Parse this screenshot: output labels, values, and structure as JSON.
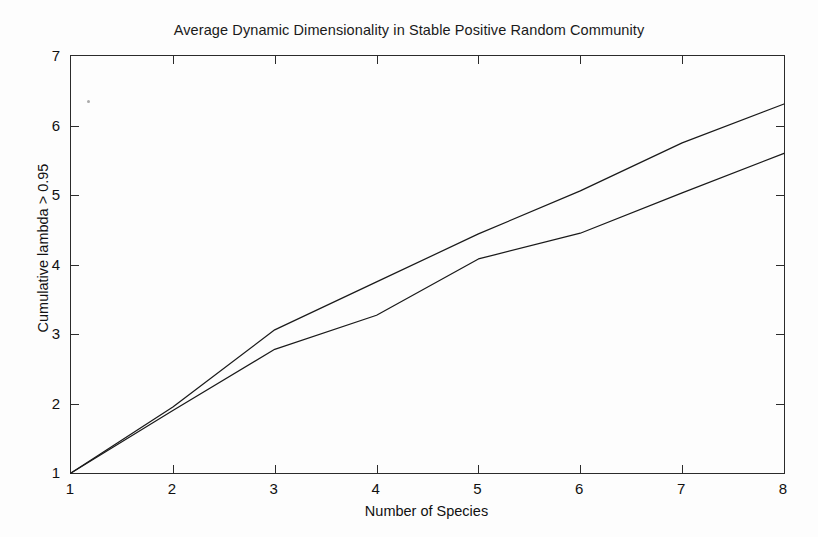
{
  "chart_data": {
    "type": "line",
    "title": "Average Dynamic Dimensionality in Stable Positive Random Community",
    "xlabel": "Number of Species",
    "ylabel": "Cumulative lambda > 0.95",
    "x": [
      1,
      2,
      3,
      4,
      5,
      6,
      7,
      8
    ],
    "xlim": [
      1,
      8
    ],
    "ylim": [
      1,
      7
    ],
    "xticks": [
      "1",
      "2",
      "3",
      "4",
      "5",
      "6",
      "7",
      "8"
    ],
    "yticks": [
      "1",
      "2",
      "3",
      "4",
      "5",
      "6",
      "7"
    ],
    "grid": false,
    "legend": "none",
    "series": [
      {
        "name": "upper-curve",
        "color": "#1a1a1a",
        "values": [
          1.0,
          1.95,
          3.06,
          3.75,
          4.44,
          5.06,
          5.75,
          6.31
        ]
      },
      {
        "name": "lower-curve",
        "color": "#1a1a1a",
        "values": [
          1.0,
          1.9,
          2.78,
          3.27,
          4.08,
          4.45,
          5.03,
          5.6
        ]
      }
    ]
  },
  "figure": {
    "background_color": "#fdfdfd",
    "axis_color": "#2b2b2b"
  }
}
